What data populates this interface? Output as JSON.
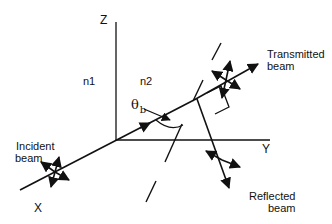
{
  "diagram": {
    "type": "brewster-angle-reflection-schematic",
    "axes": {
      "z_label": "Z",
      "y_label": "Y",
      "x_label": "X"
    },
    "media": {
      "left": "n1",
      "right": "n2"
    },
    "angle": {
      "symbol": "θ",
      "subscript": "b"
    },
    "beams": {
      "incident": {
        "line1": "Incident",
        "line2": "beam"
      },
      "transmitted": {
        "line1": "Transmitted",
        "line2": "beam"
      },
      "reflected": {
        "line1": "Reflected",
        "line2": "beam"
      }
    },
    "colors": {
      "ink": "#111111",
      "background": "#ffffff"
    }
  }
}
